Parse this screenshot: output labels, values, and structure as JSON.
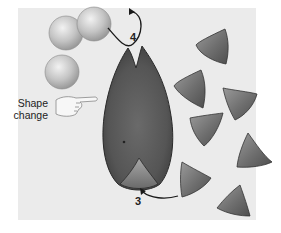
{
  "diagram": {
    "title": "",
    "labels": {
      "shape_change_line1": "Shape",
      "shape_change_line2": "change",
      "step_4": "4",
      "step_3": "3"
    },
    "elements": {
      "spheres": [
        {
          "id": "sphere-1",
          "cx": 66,
          "cy": 33,
          "r": 17
        },
        {
          "id": "sphere-2",
          "cx": 94,
          "cy": 24,
          "r": 17
        },
        {
          "id": "sphere-3",
          "cx": 62,
          "cy": 72,
          "r": 17
        }
      ],
      "triangles_count": 9,
      "enzyme": "cleft-shaped enzyme with bound triangular substrate",
      "pointing_hand_icon": "hand-pointing-right"
    },
    "colors": {
      "background": "#ffffff",
      "panel": "#ebebeb",
      "sphere": "#bdbdbd",
      "triangle": "#7a7a7a",
      "enzyme": "#5c5c5c",
      "text": "#222222"
    }
  }
}
